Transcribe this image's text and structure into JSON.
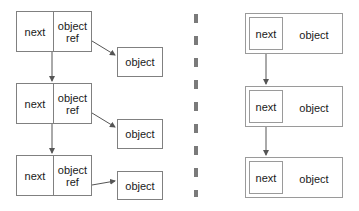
{
  "diagram": {
    "background_color": "#ffffff",
    "stroke_color": "#808080",
    "text_color": "#1a1a1a",
    "divider": {
      "name": "vertical-dashed-divider",
      "color": "#7a7a7a",
      "x": 196,
      "style": "dashed"
    },
    "left_panel": {
      "name": "separate-object-reference-panel",
      "nodes": [
        {
          "next_label": "next",
          "ref_label": "object\nref",
          "x": 16,
          "y": 11,
          "w": 76,
          "h": 41
        },
        {
          "next_label": "next",
          "ref_label": "object\nref",
          "x": 16,
          "y": 83,
          "w": 76,
          "h": 41
        },
        {
          "next_label": "next",
          "ref_label": "object\nref",
          "x": 16,
          "y": 155,
          "w": 76,
          "h": 41
        }
      ],
      "objects": [
        {
          "label": "object",
          "x": 117,
          "y": 47,
          "w": 46,
          "h": 30
        },
        {
          "label": "object",
          "x": 117,
          "y": 119,
          "w": 46,
          "h": 30
        },
        {
          "label": "object",
          "x": 117,
          "y": 171,
          "w": 46,
          "h": 29
        }
      ]
    },
    "right_panel": {
      "name": "embedded-object-panel",
      "nodes": [
        {
          "next_label": "next",
          "object_label": "object",
          "x": 245,
          "y": 13,
          "w": 98,
          "h": 41,
          "inner_x": 249,
          "inner_y": 17,
          "inner_w": 34,
          "inner_h": 33
        },
        {
          "next_label": "next",
          "object_label": "object",
          "x": 245,
          "y": 86,
          "w": 98,
          "h": 41,
          "inner_x": 249,
          "inner_y": 90,
          "inner_w": 34,
          "inner_h": 33
        },
        {
          "next_label": "next",
          "object_label": "object",
          "x": 245,
          "y": 157,
          "w": 98,
          "h": 41,
          "inner_x": 249,
          "inner_y": 161,
          "inner_w": 34,
          "inner_h": 33
        }
      ]
    }
  }
}
